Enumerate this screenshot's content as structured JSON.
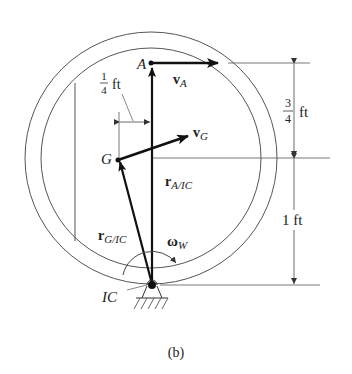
{
  "figure": {
    "caption": "(b)",
    "points": {
      "A": "A",
      "G": "G",
      "IC": "IC"
    },
    "vectors": {
      "vA": {
        "main": "v",
        "sub": "A"
      },
      "vG": {
        "main": "v",
        "sub": "G"
      },
      "rA_IC": {
        "main": "r",
        "sub": "A/IC"
      },
      "rG_IC": {
        "main": "r",
        "sub": "G/IC"
      },
      "omegaW": {
        "main": "ω",
        "sub": "W"
      }
    },
    "dimensions": {
      "horizontal_offset": {
        "num": "1",
        "den": "4",
        "unit": "ft"
      },
      "upper_vertical": {
        "num": "3",
        "den": "4",
        "unit": "ft"
      },
      "lower_vertical": {
        "value": "1 ft"
      }
    },
    "colors": {
      "line": "#333333",
      "thin_line": "#555555",
      "background": "#ffffff"
    }
  }
}
